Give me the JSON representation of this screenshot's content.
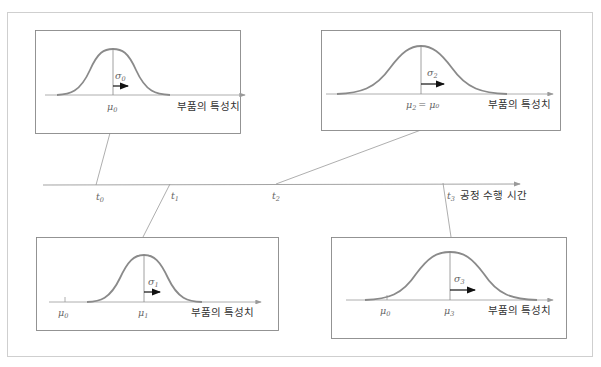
{
  "diagram": {
    "time_axis": {
      "label": "공정 수행 시간",
      "ticks": [
        {
          "sym": "t",
          "sub": "0"
        },
        {
          "sym": "t",
          "sub": "1"
        },
        {
          "sym": "t",
          "sub": "2"
        },
        {
          "sym": "t",
          "sub": "3"
        }
      ]
    },
    "panels": [
      {
        "id": "t0",
        "axis_label": "부품의 특성치",
        "mean_label": {
          "sym": "μ",
          "sub": "0",
          "suffix": ""
        },
        "sigma_label": {
          "sym": "σ",
          "sub": "0"
        },
        "reference_label": null
      },
      {
        "id": "t2",
        "axis_label": "부품의 특성치",
        "mean_label": {
          "sym": "μ",
          "sub": "2",
          "suffix": "= μ₀"
        },
        "sigma_label": {
          "sym": "σ",
          "sub": "2"
        },
        "reference_label": null
      },
      {
        "id": "t1",
        "axis_label": "부품의 특성치",
        "mean_label": {
          "sym": "μ",
          "sub": "1",
          "suffix": ""
        },
        "sigma_label": {
          "sym": "σ",
          "sub": "1"
        },
        "reference_label": {
          "sym": "μ",
          "sub": "0"
        }
      },
      {
        "id": "t3",
        "axis_label": "부품의 특성치",
        "mean_label": {
          "sym": "μ",
          "sub": "3",
          "suffix": ""
        },
        "sigma_label": {
          "sym": "σ",
          "sub": "3"
        },
        "reference_label": {
          "sym": "μ",
          "sub": "0"
        }
      }
    ],
    "colors": {
      "curve": "#8a8a8a",
      "line": "#999999",
      "frame": "#c8c8c8",
      "box": "#888888",
      "arrow": "#111111"
    }
  }
}
